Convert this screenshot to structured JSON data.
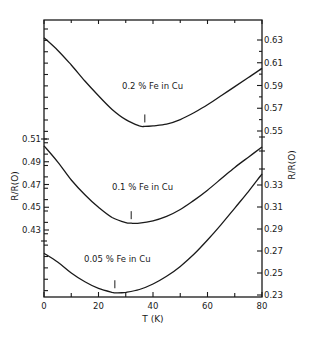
{
  "chart_data": {
    "type": "line",
    "title": "",
    "xlabel": "T (K)",
    "ylabel_left": "R/R(O)",
    "ylabel_right": "R/R(O)",
    "xlim": [
      0,
      80
    ],
    "x_ticks": [
      0,
      20,
      40,
      60,
      80
    ],
    "x_minor_ticks": [
      10,
      30,
      50,
      70
    ],
    "left_axis": {
      "ticks": [
        0.51,
        0.49,
        0.47,
        0.45,
        0.43
      ],
      "tick_labels": [
        "0.51",
        "0.49",
        "0.47",
        "0.45",
        "0.43"
      ],
      "applies_to": "0.1 % Fe in Cu"
    },
    "right_axis_upper": {
      "ticks": [
        0.63,
        0.61,
        0.59,
        0.57,
        0.55
      ],
      "tick_labels": [
        "0.63",
        "0.61",
        "0.59",
        "0.57",
        "0.55"
      ],
      "applies_to": "0.2 % Fe in Cu"
    },
    "right_axis_lower": {
      "ticks": [
        0.33,
        0.31,
        0.29,
        0.27,
        0.25,
        0.23
      ],
      "tick_labels": [
        "0.33",
        "0.31",
        "0.29",
        "0.27",
        "0.25",
        "0.23"
      ],
      "applies_to": "0.05 % Fe in Cu"
    },
    "series": [
      {
        "name": "0.2 % Fe in Cu",
        "axis": "right_upper",
        "x": [
          0,
          5,
          10,
          15,
          20,
          25,
          30,
          35,
          37,
          40,
          45,
          50,
          55,
          60,
          65,
          70,
          75,
          80
        ],
        "values": [
          0.632,
          0.621,
          0.608,
          0.594,
          0.581,
          0.569,
          0.56,
          0.5545,
          0.554,
          0.5545,
          0.556,
          0.56,
          0.566,
          0.573,
          0.581,
          0.589,
          0.597,
          0.605
        ],
        "minimum_marker_T": 37
      },
      {
        "name": "0.1 % Fe in Cu",
        "axis": "left",
        "x": [
          0,
          5,
          10,
          15,
          20,
          25,
          30,
          32,
          35,
          40,
          45,
          50,
          55,
          60,
          65,
          70,
          75,
          80
        ],
        "values": [
          0.504,
          0.49,
          0.474,
          0.461,
          0.45,
          0.441,
          0.4365,
          0.436,
          0.436,
          0.438,
          0.442,
          0.448,
          0.456,
          0.465,
          0.475,
          0.485,
          0.494,
          0.503
        ],
        "minimum_marker_T": 32
      },
      {
        "name": "0.05 % Fe in Cu",
        "axis": "right_lower",
        "x": [
          0,
          5,
          10,
          15,
          20,
          25,
          27,
          30,
          35,
          40,
          45,
          50,
          55,
          60,
          65,
          70,
          75,
          80
        ],
        "values": [
          0.268,
          0.26,
          0.25,
          0.242,
          0.236,
          0.2325,
          0.232,
          0.2325,
          0.235,
          0.24,
          0.247,
          0.256,
          0.267,
          0.28,
          0.294,
          0.309,
          0.324,
          0.34
        ],
        "minimum_marker_T": 26
      }
    ],
    "annotations": [
      "0.2 % Fe in Cu",
      "0.1 % Fe in Cu",
      "0.05 % Fe in Cu"
    ],
    "grid": false,
    "legend": "none (inline curve labels)"
  },
  "labels": {
    "curve_top": "0.2 % Fe in Cu",
    "curve_mid": "0.1 % Fe in Cu",
    "curve_bot": "0.05 % Fe in Cu",
    "xlabel": "T (K)",
    "ylabel_left": "R/R(O)",
    "ylabel_right": "R/R(O)"
  }
}
